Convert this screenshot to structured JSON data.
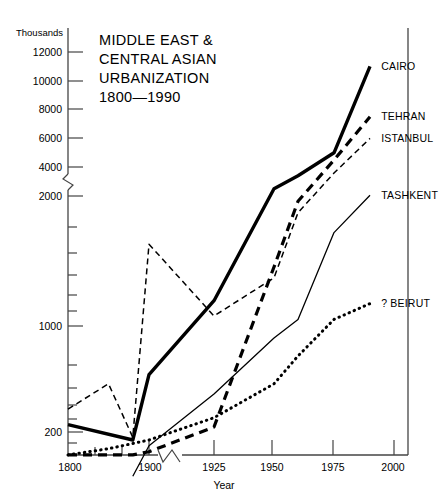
{
  "chart_data": {
    "type": "line",
    "title": "MIDDLE EAST & CENTRAL ASIAN URBANIZATION 1800—1990",
    "title_lines": [
      "MIDDLE EAST &",
      "CENTRAL ASIAN",
      "URBANIZATION",
      "1800—1990"
    ],
    "xlabel": "Year",
    "ylabel": "",
    "unit_label": "Thousands",
    "grid": false,
    "legend_position": "right-inline-labels",
    "x_ticks": [
      1800,
      1900,
      1925,
      1950,
      1975,
      2000
    ],
    "x_tick_labels": [
      "1800",
      "1900",
      "1925",
      "1950",
      "1975",
      "2000"
    ],
    "x_minor_ticks": [
      1825,
      1850,
      1875
    ],
    "x_axis_break_after": 1900,
    "y_ticks": [
      200,
      300,
      400,
      500,
      600,
      700,
      800,
      900,
      1000,
      2000,
      4000,
      6000,
      8000,
      10000,
      12000
    ],
    "y_tick_labels": [
      "200",
      "",
      "",
      "",
      "",
      "",
      "",
      "",
      "1000",
      "2000",
      "4000",
      "6000",
      "8000",
      "10000",
      "12000"
    ],
    "y_scale": "log below 2000, linear above 2000",
    "y_axis_break_between": [
      2000,
      4000
    ],
    "ylim": [
      150,
      12800
    ],
    "series": [
      {
        "name": "CAIRO",
        "style": "thick-solid",
        "color": "#000000",
        "x": [
          1800,
          1880,
          1900,
          1925,
          1950,
          1960,
          1975,
          1990
        ],
        "values": [
          215,
          185,
          350,
          720,
          2500,
          3400,
          5000,
          11000
        ]
      },
      {
        "name": "TEHRAN",
        "style": "thick-dashed",
        "color": "#000000",
        "x": [
          1800,
          1880,
          1900,
          1925,
          1950,
          1960,
          1975,
          1990
        ],
        "values": [
          160,
          160,
          165,
          210,
          1000,
          1900,
          4500,
          7500
        ]
      },
      {
        "name": "ISTANBUL",
        "style": "thin-dashed",
        "color": "#000000",
        "x": [
          1800,
          1850,
          1880,
          1900,
          1925,
          1950,
          1960,
          1975,
          1990
        ],
        "values": [
          250,
          320,
          190,
          1250,
          620,
          900,
          1700,
          3600,
          6000
        ]
      },
      {
        "name": "TASHKENT",
        "style": "thin-solid",
        "color": "#000000",
        "x": [
          1880,
          1900,
          1925,
          1950,
          1960,
          1975,
          1990
        ],
        "values": [
          130,
          175,
          290,
          500,
          600,
          1400,
          2050
        ]
      },
      {
        "name": "? BEIRUT",
        "style": "dotted",
        "color": "#000000",
        "x": [
          1800,
          1850,
          1900,
          1925,
          1950,
          1960,
          1975,
          1990
        ],
        "values": [
          160,
          170,
          185,
          230,
          320,
          420,
          600,
          700
        ]
      }
    ],
    "annotations": [
      {
        "text": "CAIRO",
        "x": 1993,
        "y": 11000
      },
      {
        "text": "TEHRAN",
        "x": 1993,
        "y": 7500
      },
      {
        "text": "ISTANBUL",
        "x": 1993,
        "y": 6000
      },
      {
        "text": "TASHKENT",
        "x": 1993,
        "y": 2050
      },
      {
        "text": "? BEIRUT",
        "x": 1993,
        "y": 700
      }
    ]
  }
}
